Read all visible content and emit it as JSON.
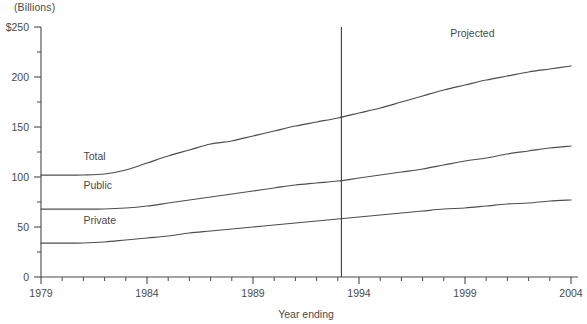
{
  "chart_data": {
    "type": "line",
    "title": "",
    "unit_note": "(Billions)",
    "xlabel": "Year ending",
    "ylabel": "",
    "xlim": [
      1979,
      2004
    ],
    "ylim": [
      0,
      250
    ],
    "grid": false,
    "legend_position": "inline-left",
    "x": [
      1979,
      1980,
      1981,
      1982,
      1983,
      1984,
      1985,
      1986,
      1987,
      1988,
      1989,
      1990,
      1991,
      1992,
      1993,
      1994,
      1995,
      1996,
      1997,
      1998,
      1999,
      2000,
      2001,
      2002,
      2003,
      2004
    ],
    "y_ticks_major": [
      0,
      50,
      100,
      150,
      200,
      250
    ],
    "y_tick_labels": [
      "0",
      "50",
      "100",
      "150",
      "200",
      "$250"
    ],
    "x_ticks_major": [
      1979,
      1984,
      1989,
      1994,
      1999,
      2004
    ],
    "x_tick_labels": [
      "1979",
      "1984",
      "1989",
      "1994",
      "1999",
      "2004"
    ],
    "series": [
      {
        "name": "Total",
        "label": "Total",
        "label_x": 1981.0,
        "label_y": 117,
        "values": [
          102,
          102,
          102,
          103,
          107,
          114,
          121,
          127,
          133,
          136,
          141,
          146,
          151,
          155,
          159,
          164,
          169,
          175,
          181,
          187,
          192,
          197,
          201,
          205,
          208,
          211
        ]
      },
      {
        "name": "Public",
        "label": "Public",
        "label_x": 1981.0,
        "label_y": 88,
        "values": [
          68,
          68,
          68,
          68,
          69,
          71,
          74,
          77,
          80,
          83,
          86,
          89,
          92,
          94,
          96,
          99,
          102,
          105,
          108,
          112,
          116,
          119,
          123,
          126,
          129,
          131
        ]
      },
      {
        "name": "Private",
        "label": "Private",
        "label_x": 1981.0,
        "label_y": 53,
        "values": [
          34,
          34,
          34,
          35,
          37,
          39,
          41,
          44,
          46,
          48,
          50,
          52,
          54,
          56,
          58,
          60,
          62,
          64,
          66,
          68,
          69,
          71,
          73,
          74,
          76,
          77
        ]
      }
    ],
    "annotations": [
      {
        "name": "projected-divider",
        "type": "vline",
        "x": 1993.17,
        "label": "Projected",
        "label_x": 1998.3,
        "label_y": 240
      }
    ]
  }
}
